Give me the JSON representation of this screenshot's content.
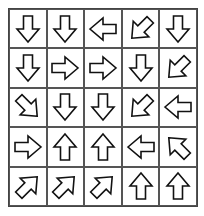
{
  "puzzle": {
    "rows": 5,
    "cols": 5,
    "arrows": [
      [
        "down",
        "down",
        "left",
        "down-left",
        "down"
      ],
      [
        "down",
        "right",
        "right",
        "down",
        "down-left"
      ],
      [
        "down-right",
        "down",
        "down",
        "down-left",
        "left"
      ],
      [
        "right",
        "up",
        "up",
        "left",
        "up-left"
      ],
      [
        "up-right",
        "up-right",
        "up-right",
        "up",
        "up"
      ]
    ]
  },
  "colors": {
    "stroke": "#111111",
    "grid": "#555555",
    "fill": "#ffffff"
  }
}
